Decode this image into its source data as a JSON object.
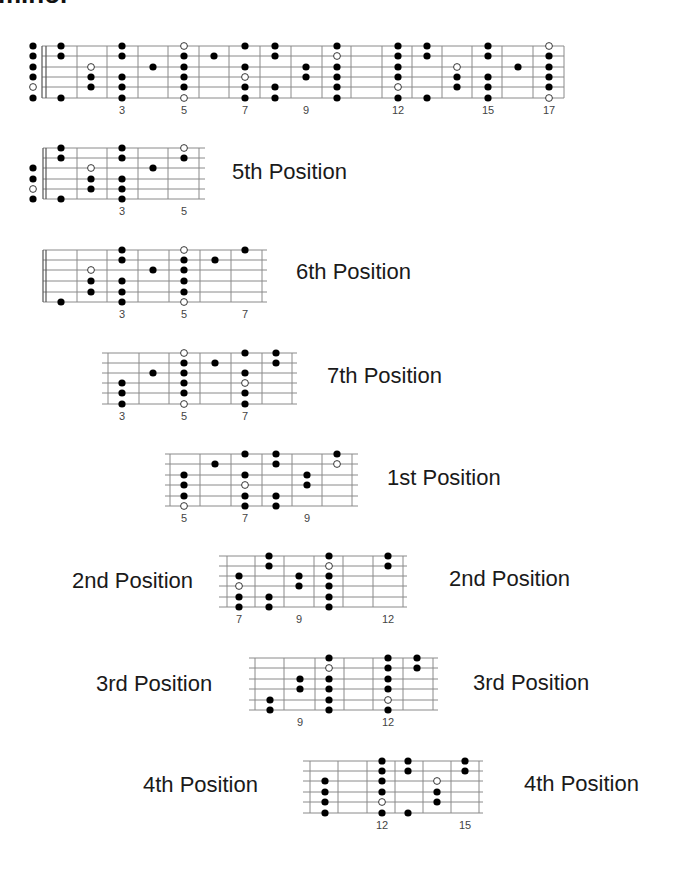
{
  "heading": {
    "text": "minor"
  },
  "style": {
    "line_color": "#8a8a8a",
    "dot_color": "#000000",
    "open_fill": "#ffffff"
  },
  "diagrams": [
    {
      "id": "full-neck",
      "label": "",
      "strings_y": [
        46,
        56,
        67,
        77,
        87,
        98
      ],
      "x_start": 42,
      "x_end": 564,
      "nut": [
        42,
        46
      ],
      "frets_x": [
        77,
        107,
        138,
        168,
        199,
        229,
        260,
        291,
        322,
        351,
        382,
        412,
        442,
        472,
        502,
        533,
        564
      ],
      "fret_numbers": [
        {
          "n": "3",
          "x": 122
        },
        {
          "n": "5",
          "x": 184
        },
        {
          "n": "7",
          "x": 245
        },
        {
          "n": "9",
          "x": 306
        },
        {
          "n": "12",
          "x": 398
        },
        {
          "n": "15",
          "x": 488
        },
        {
          "n": "17",
          "x": 549
        }
      ],
      "fret_numbers_y": 114,
      "dots": [
        {
          "x": 33,
          "s": 1
        },
        {
          "x": 33,
          "s": 2
        },
        {
          "x": 33,
          "s": 3
        },
        {
          "x": 33,
          "s": 4
        },
        {
          "x": 33,
          "s": 5,
          "open": true
        },
        {
          "x": 33,
          "s": 6
        },
        {
          "x": 61,
          "s": 1
        },
        {
          "x": 61,
          "s": 2
        },
        {
          "x": 61,
          "s": 6
        },
        {
          "x": 91,
          "s": 3,
          "open": true
        },
        {
          "x": 91,
          "s": 4
        },
        {
          "x": 91,
          "s": 5
        },
        {
          "x": 122,
          "s": 1
        },
        {
          "x": 122,
          "s": 2
        },
        {
          "x": 122,
          "s": 4
        },
        {
          "x": 122,
          "s": 5
        },
        {
          "x": 122,
          "s": 6
        },
        {
          "x": 153,
          "s": 3
        },
        {
          "x": 184,
          "s": 1,
          "open": true
        },
        {
          "x": 184,
          "s": 2
        },
        {
          "x": 184,
          "s": 3
        },
        {
          "x": 184,
          "s": 4
        },
        {
          "x": 184,
          "s": 5
        },
        {
          "x": 184,
          "s": 6,
          "open": true
        },
        {
          "x": 214,
          "s": 2
        },
        {
          "x": 245,
          "s": 1
        },
        {
          "x": 245,
          "s": 3
        },
        {
          "x": 245,
          "s": 4,
          "open": true
        },
        {
          "x": 245,
          "s": 5
        },
        {
          "x": 245,
          "s": 6
        },
        {
          "x": 275,
          "s": 1
        },
        {
          "x": 275,
          "s": 2
        },
        {
          "x": 275,
          "s": 5
        },
        {
          "x": 275,
          "s": 6
        },
        {
          "x": 306,
          "s": 3
        },
        {
          "x": 306,
          "s": 4
        },
        {
          "x": 337,
          "s": 1
        },
        {
          "x": 337,
          "s": 2,
          "open": true
        },
        {
          "x": 337,
          "s": 3
        },
        {
          "x": 337,
          "s": 4
        },
        {
          "x": 337,
          "s": 5
        },
        {
          "x": 337,
          "s": 6
        },
        {
          "x": 398,
          "s": 1
        },
        {
          "x": 398,
          "s": 2
        },
        {
          "x": 398,
          "s": 3
        },
        {
          "x": 398,
          "s": 4
        },
        {
          "x": 398,
          "s": 5,
          "open": true
        },
        {
          "x": 398,
          "s": 6
        },
        {
          "x": 427,
          "s": 1
        },
        {
          "x": 427,
          "s": 2
        },
        {
          "x": 427,
          "s": 6
        },
        {
          "x": 457,
          "s": 3,
          "open": true
        },
        {
          "x": 457,
          "s": 4
        },
        {
          "x": 457,
          "s": 5
        },
        {
          "x": 488,
          "s": 1
        },
        {
          "x": 488,
          "s": 2
        },
        {
          "x": 488,
          "s": 4
        },
        {
          "x": 488,
          "s": 5
        },
        {
          "x": 488,
          "s": 6
        },
        {
          "x": 518,
          "s": 3
        },
        {
          "x": 549,
          "s": 1,
          "open": true
        },
        {
          "x": 549,
          "s": 2
        },
        {
          "x": 549,
          "s": 3
        },
        {
          "x": 549,
          "s": 4
        },
        {
          "x": 549,
          "s": 5
        },
        {
          "x": 549,
          "s": 6,
          "open": true
        }
      ]
    },
    {
      "id": "5th-position",
      "labels": [
        {
          "text": "5th Position",
          "x": 232,
          "y": 161
        }
      ],
      "strings_y": [
        148,
        158,
        168,
        179,
        189,
        199
      ],
      "x_start": 43,
      "x_end": 205,
      "nut": [
        43,
        46
      ],
      "frets_x": [
        77,
        107,
        138,
        168,
        199
      ],
      "fret_numbers": [
        {
          "n": "3",
          "x": 122
        },
        {
          "n": "5",
          "x": 184
        }
      ],
      "fret_numbers_y": 215,
      "dots": [
        {
          "x": 33,
          "s": 3
        },
        {
          "x": 33,
          "s": 4
        },
        {
          "x": 33,
          "s": 5,
          "open": true
        },
        {
          "x": 33,
          "s": 6
        },
        {
          "x": 61,
          "s": 1
        },
        {
          "x": 61,
          "s": 2
        },
        {
          "x": 61,
          "s": 6
        },
        {
          "x": 91,
          "s": 3,
          "open": true
        },
        {
          "x": 91,
          "s": 4
        },
        {
          "x": 91,
          "s": 5
        },
        {
          "x": 122,
          "s": 1
        },
        {
          "x": 122,
          "s": 2
        },
        {
          "x": 122,
          "s": 4
        },
        {
          "x": 122,
          "s": 5
        },
        {
          "x": 122,
          "s": 6
        },
        {
          "x": 153,
          "s": 3
        },
        {
          "x": 184,
          "s": 1,
          "open": true
        },
        {
          "x": 184,
          "s": 2
        }
      ]
    },
    {
      "id": "6th-position",
      "labels": [
        {
          "text": "6th Position",
          "x": 296,
          "y": 261
        }
      ],
      "strings_y": [
        250,
        260,
        270,
        281,
        292,
        302
      ],
      "x_start": 43,
      "x_end": 267,
      "nut": [
        43,
        46
      ],
      "frets_x": [
        77,
        107,
        138,
        169,
        200,
        231,
        262
      ],
      "fret_numbers": [
        {
          "n": "3",
          "x": 122
        },
        {
          "n": "5",
          "x": 184
        },
        {
          "n": "7",
          "x": 245
        }
      ],
      "fret_numbers_y": 318,
      "dots": [
        {
          "x": 61,
          "s": 6
        },
        {
          "x": 91,
          "s": 3,
          "open": true
        },
        {
          "x": 91,
          "s": 4
        },
        {
          "x": 91,
          "s": 5
        },
        {
          "x": 122,
          "s": 1
        },
        {
          "x": 122,
          "s": 2
        },
        {
          "x": 122,
          "s": 4
        },
        {
          "x": 122,
          "s": 5
        },
        {
          "x": 122,
          "s": 6
        },
        {
          "x": 153,
          "s": 3
        },
        {
          "x": 184,
          "s": 1,
          "open": true
        },
        {
          "x": 184,
          "s": 2
        },
        {
          "x": 184,
          "s": 3
        },
        {
          "x": 184,
          "s": 4
        },
        {
          "x": 184,
          "s": 5
        },
        {
          "x": 184,
          "s": 6,
          "open": true
        },
        {
          "x": 215,
          "s": 2
        },
        {
          "x": 245,
          "s": 1
        }
      ]
    },
    {
      "id": "7th-position",
      "labels": [
        {
          "text": "7th Position",
          "x": 327,
          "y": 365
        }
      ],
      "strings_y": [
        353,
        363,
        373,
        383,
        393,
        404
      ],
      "x_start": 102,
      "x_end": 297,
      "nut": [],
      "frets_x": [
        108,
        139,
        169,
        200,
        231,
        262,
        292
      ],
      "fret_numbers": [
        {
          "n": "3",
          "x": 122
        },
        {
          "n": "5",
          "x": 184
        },
        {
          "n": "7",
          "x": 245
        }
      ],
      "fret_numbers_y": 420,
      "dots": [
        {
          "x": 122,
          "s": 4
        },
        {
          "x": 122,
          "s": 5
        },
        {
          "x": 122,
          "s": 6
        },
        {
          "x": 153,
          "s": 3
        },
        {
          "x": 184,
          "s": 1,
          "open": true
        },
        {
          "x": 184,
          "s": 2
        },
        {
          "x": 184,
          "s": 3
        },
        {
          "x": 184,
          "s": 4
        },
        {
          "x": 184,
          "s": 5
        },
        {
          "x": 184,
          "s": 6,
          "open": true
        },
        {
          "x": 215,
          "s": 2
        },
        {
          "x": 245,
          "s": 1
        },
        {
          "x": 245,
          "s": 3
        },
        {
          "x": 245,
          "s": 4,
          "open": true
        },
        {
          "x": 245,
          "s": 5
        },
        {
          "x": 245,
          "s": 6
        },
        {
          "x": 276,
          "s": 1
        },
        {
          "x": 276,
          "s": 2
        }
      ]
    },
    {
      "id": "1st-position",
      "labels": [
        {
          "text": "1st Position",
          "x": 387,
          "y": 467
        }
      ],
      "strings_y": [
        454,
        464,
        475,
        485,
        496,
        506
      ],
      "x_start": 165,
      "x_end": 358,
      "nut": [],
      "frets_x": [
        170,
        200,
        231,
        262,
        292,
        322,
        352
      ],
      "fret_numbers": [
        {
          "n": "5",
          "x": 184
        },
        {
          "n": "7",
          "x": 245
        },
        {
          "n": "9",
          "x": 307
        }
      ],
      "fret_numbers_y": 522,
      "dots": [
        {
          "x": 184,
          "s": 3
        },
        {
          "x": 184,
          "s": 4
        },
        {
          "x": 184,
          "s": 5
        },
        {
          "x": 184,
          "s": 6,
          "open": true
        },
        {
          "x": 215,
          "s": 2
        },
        {
          "x": 245,
          "s": 1
        },
        {
          "x": 245,
          "s": 3
        },
        {
          "x": 245,
          "s": 4,
          "open": true
        },
        {
          "x": 245,
          "s": 5
        },
        {
          "x": 245,
          "s": 6
        },
        {
          "x": 276,
          "s": 1
        },
        {
          "x": 276,
          "s": 2
        },
        {
          "x": 276,
          "s": 5
        },
        {
          "x": 276,
          "s": 6
        },
        {
          "x": 307,
          "s": 3
        },
        {
          "x": 307,
          "s": 4
        },
        {
          "x": 337,
          "s": 1
        },
        {
          "x": 337,
          "s": 2,
          "open": true
        }
      ]
    },
    {
      "id": "2nd-position",
      "labels": [
        {
          "text": "2nd Position",
          "x": 72,
          "y": 570
        },
        {
          "text": "2nd Position",
          "x": 449,
          "y": 568
        }
      ],
      "strings_y": [
        556,
        566,
        576,
        586,
        597,
        607
      ],
      "x_start": 219,
      "x_end": 407,
      "nut": [],
      "frets_x": [
        227,
        255,
        284,
        314,
        343,
        373,
        403
      ],
      "fret_numbers": [
        {
          "n": "7",
          "x": 239
        },
        {
          "n": "9",
          "x": 299
        },
        {
          "n": "12",
          "x": 388
        }
      ],
      "fret_numbers_y": 623,
      "dots": [
        {
          "x": 239,
          "s": 3
        },
        {
          "x": 239,
          "s": 4,
          "open": true
        },
        {
          "x": 239,
          "s": 5
        },
        {
          "x": 239,
          "s": 6
        },
        {
          "x": 269,
          "s": 1
        },
        {
          "x": 269,
          "s": 2
        },
        {
          "x": 269,
          "s": 5
        },
        {
          "x": 269,
          "s": 6
        },
        {
          "x": 299,
          "s": 3
        },
        {
          "x": 299,
          "s": 4
        },
        {
          "x": 329,
          "s": 1
        },
        {
          "x": 329,
          "s": 2,
          "open": true
        },
        {
          "x": 329,
          "s": 3
        },
        {
          "x": 329,
          "s": 4
        },
        {
          "x": 329,
          "s": 5
        },
        {
          "x": 329,
          "s": 6
        },
        {
          "x": 388,
          "s": 1
        },
        {
          "x": 388,
          "s": 2
        }
      ]
    },
    {
      "id": "3rd-position",
      "labels": [
        {
          "text": "3rd Position",
          "x": 96,
          "y": 673
        },
        {
          "text": "3rd Position",
          "x": 473,
          "y": 672
        }
      ],
      "strings_y": [
        658,
        668,
        679,
        689,
        700,
        710
      ],
      "x_start": 249,
      "x_end": 438,
      "nut": [],
      "frets_x": [
        255,
        284,
        315,
        344,
        373,
        403,
        433
      ],
      "fret_numbers": [
        {
          "n": "9",
          "x": 300
        },
        {
          "n": "12",
          "x": 388
        }
      ],
      "fret_numbers_y": 726,
      "dots": [
        {
          "x": 270,
          "s": 5
        },
        {
          "x": 270,
          "s": 6
        },
        {
          "x": 300,
          "s": 3
        },
        {
          "x": 300,
          "s": 4
        },
        {
          "x": 329,
          "s": 1
        },
        {
          "x": 329,
          "s": 2,
          "open": true
        },
        {
          "x": 329,
          "s": 3
        },
        {
          "x": 329,
          "s": 4
        },
        {
          "x": 329,
          "s": 5
        },
        {
          "x": 329,
          "s": 6
        },
        {
          "x": 388,
          "s": 1
        },
        {
          "x": 388,
          "s": 2
        },
        {
          "x": 388,
          "s": 3
        },
        {
          "x": 388,
          "s": 4
        },
        {
          "x": 388,
          "s": 5,
          "open": true
        },
        {
          "x": 388,
          "s": 6
        },
        {
          "x": 417,
          "s": 1
        },
        {
          "x": 417,
          "s": 2
        }
      ]
    },
    {
      "id": "4th-position",
      "labels": [
        {
          "text": "4th Position",
          "x": 143,
          "y": 774
        },
        {
          "text": "4th Position",
          "x": 524,
          "y": 773
        }
      ],
      "strings_y": [
        761,
        771,
        781,
        792,
        802,
        813
      ],
      "x_start": 303,
      "x_end": 483,
      "nut": [],
      "frets_x": [
        310,
        338,
        367,
        395,
        423,
        451,
        479
      ],
      "fret_numbers": [
        {
          "n": "12",
          "x": 382
        },
        {
          "n": "15",
          "x": 465
        }
      ],
      "fret_numbers_y": 829,
      "dots": [
        {
          "x": 325,
          "s": 3
        },
        {
          "x": 325,
          "s": 4
        },
        {
          "x": 325,
          "s": 5
        },
        {
          "x": 325,
          "s": 6
        },
        {
          "x": 382,
          "s": 1
        },
        {
          "x": 382,
          "s": 2
        },
        {
          "x": 382,
          "s": 3
        },
        {
          "x": 382,
          "s": 4
        },
        {
          "x": 382,
          "s": 5,
          "open": true
        },
        {
          "x": 382,
          "s": 6
        },
        {
          "x": 408,
          "s": 1
        },
        {
          "x": 408,
          "s": 2
        },
        {
          "x": 408,
          "s": 6
        },
        {
          "x": 437,
          "s": 3,
          "open": true
        },
        {
          "x": 437,
          "s": 4
        },
        {
          "x": 437,
          "s": 5
        },
        {
          "x": 465,
          "s": 1
        },
        {
          "x": 465,
          "s": 2
        }
      ]
    }
  ]
}
